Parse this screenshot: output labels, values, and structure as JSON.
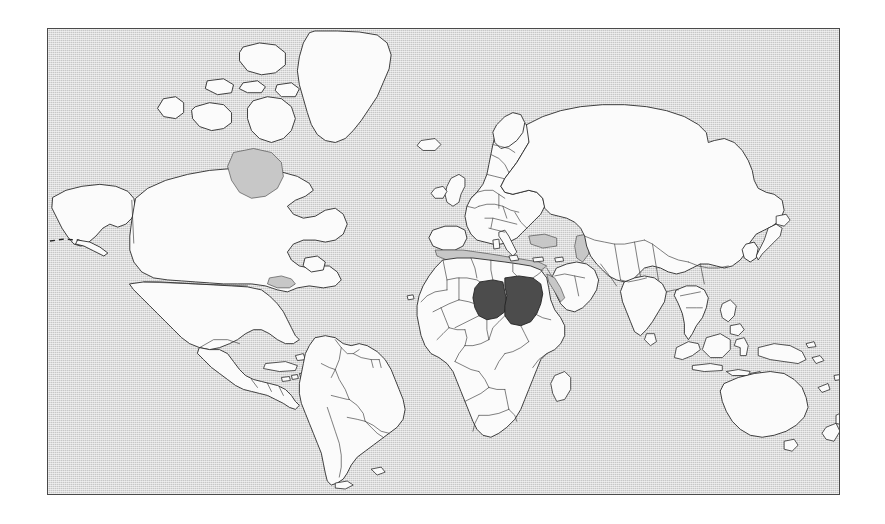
{
  "figure": {
    "type": "locator-map",
    "title": "World locator map",
    "projection": "cylindrical",
    "frame": {
      "border_color": "#4a4a4a",
      "page_background": "#ffffff"
    },
    "colors": {
      "ocean": "#c7c7c7",
      "land": "#fbfbfb",
      "land_border": "#2b2b2b",
      "internal_border": "#3a3a3a",
      "highlight_fill": "#4c4c4c",
      "highlight_border": "#222222"
    },
    "legend_visible": false,
    "labels_visible": false,
    "graticule_visible": false
  },
  "highlighted_countries": [
    {
      "name": "Chad",
      "position": "north-central Africa"
    },
    {
      "name": "Sudan",
      "position": "north-east Africa"
    }
  ],
  "continents_shown": [
    "North America",
    "South America",
    "Europe",
    "Africa",
    "Asia",
    "Australia"
  ],
  "notable_features": [
    "Greenland",
    "Iceland",
    "British Isles",
    "Madagascar",
    "Japan",
    "Philippines",
    "Indonesia",
    "New Zealand",
    "Tasmania",
    "Caspian Sea",
    "Black Sea",
    "Mediterranean Sea",
    "Great Lakes",
    "Hudson Bay",
    "Red Sea"
  ],
  "annotations": {
    "dashed_boundary": "maritime dashed line near Aleutian Islands"
  }
}
